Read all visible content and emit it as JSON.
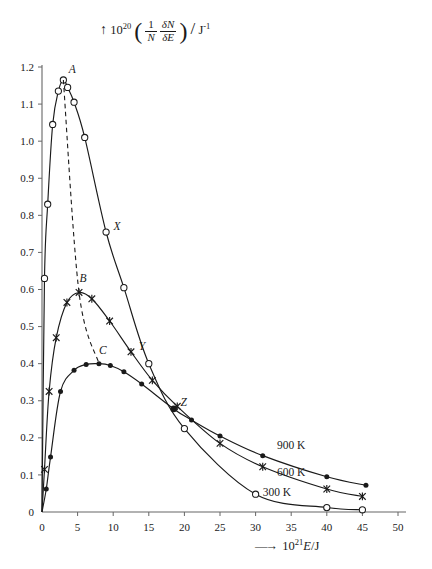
{
  "chart_data": {
    "type": "line",
    "title": "",
    "ylabel_parts": {
      "prefix": "10",
      "prefix_exp": "20",
      "numerator_1": "1",
      "denominator_1": "N",
      "numerator_2": "δN",
      "denominator_2": "δE",
      "unit": "J",
      "unit_exp": "-1"
    },
    "xlabel_parts": {
      "prefix": "10",
      "prefix_exp": "21",
      "variable": "E",
      "unit": "J"
    },
    "xlim": [
      0,
      50
    ],
    "ylim": [
      0,
      1.2
    ],
    "xticks": [
      0,
      5,
      10,
      15,
      20,
      25,
      30,
      35,
      40,
      45,
      50
    ],
    "xticklabels": [
      "0",
      "5",
      "10",
      "15",
      "20",
      "25",
      "30",
      "35",
      "40",
      "45",
      "50"
    ],
    "yticks": [
      0,
      0.1,
      0.2,
      0.3,
      0.4,
      0.5,
      0.6,
      0.7,
      0.8,
      0.9,
      1.0,
      1.1,
      1.2
    ],
    "yticklabels": [
      "0",
      "0.1",
      "0.2",
      "0.3",
      "0.4",
      "0.5",
      "0.6",
      "0.7",
      "0.8",
      "0.9",
      "1.0",
      "1.1",
      "1.2"
    ],
    "grid": false,
    "legend_position": "inline-right",
    "series": [
      {
        "name": "300 K",
        "label": "300 K",
        "marker": "open-circle",
        "color": "#1a1a1a",
        "points": [
          [
            0.0,
            0.0
          ],
          [
            0.35,
            0.63
          ],
          [
            0.8,
            0.83
          ],
          [
            1.5,
            1.045
          ],
          [
            2.3,
            1.135
          ],
          [
            3.0,
            1.165
          ],
          [
            3.6,
            1.145
          ],
          [
            4.5,
            1.105
          ],
          [
            6.0,
            1.01
          ],
          [
            9.0,
            0.755
          ],
          [
            11.5,
            0.605
          ],
          [
            15.0,
            0.4
          ],
          [
            20.0,
            0.225
          ],
          [
            30.0,
            0.048
          ],
          [
            40.0,
            0.012
          ],
          [
            45.0,
            0.006
          ]
        ]
      },
      {
        "name": "600 K",
        "label": "600 K",
        "marker": "cross",
        "color": "#1a1a1a",
        "points": [
          [
            0.0,
            0.0
          ],
          [
            0.35,
            0.115
          ],
          [
            1.0,
            0.325
          ],
          [
            2.0,
            0.47
          ],
          [
            3.5,
            0.565
          ],
          [
            5.2,
            0.592
          ],
          [
            7.0,
            0.575
          ],
          [
            9.5,
            0.515
          ],
          [
            12.5,
            0.432
          ],
          [
            15.5,
            0.355
          ],
          [
            19.0,
            0.285
          ],
          [
            25.0,
            0.185
          ],
          [
            31.0,
            0.122
          ],
          [
            40.0,
            0.062
          ],
          [
            45.0,
            0.042
          ]
        ]
      },
      {
        "name": "900 K",
        "label": "900 K",
        "marker": "filled-dot",
        "color": "#1a1a1a",
        "points": [
          [
            0.0,
            0.0
          ],
          [
            0.6,
            0.062
          ],
          [
            1.2,
            0.148
          ],
          [
            2.6,
            0.325
          ],
          [
            4.5,
            0.382
          ],
          [
            6.2,
            0.398
          ],
          [
            8.0,
            0.4
          ],
          [
            9.6,
            0.395
          ],
          [
            11.5,
            0.378
          ],
          [
            14.0,
            0.345
          ],
          [
            18.5,
            0.278
          ],
          [
            21.0,
            0.248
          ],
          [
            25.0,
            0.205
          ],
          [
            31.0,
            0.152
          ],
          [
            40.0,
            0.095
          ],
          [
            45.5,
            0.072
          ]
        ]
      }
    ],
    "peak_line": {
      "style": "dashed",
      "points": [
        [
          3.0,
          1.165
        ],
        [
          5.2,
          0.592
        ],
        [
          8.0,
          0.4
        ]
      ]
    },
    "annotations": [
      {
        "text": "A",
        "x": 3.0,
        "y": 1.165,
        "dx": 9,
        "dy": -7,
        "marker": "none"
      },
      {
        "text": "B",
        "x": 5.2,
        "y": 0.592,
        "dx": 4,
        "dy": -10,
        "marker": "none"
      },
      {
        "text": "C",
        "x": 8.0,
        "y": 0.4,
        "dx": 4,
        "dy": -10,
        "marker": "none"
      },
      {
        "text": "X",
        "x": 9.0,
        "y": 0.755,
        "dx": 11,
        "dy": -2,
        "marker": "none"
      },
      {
        "text": "Y",
        "x": 12.5,
        "y": 0.432,
        "dx": 11,
        "dy": -2,
        "marker": "none"
      },
      {
        "text": "Z",
        "x": 18.5,
        "y": 0.278,
        "dx": 10,
        "dy": -3,
        "marker": "filled-dot"
      }
    ],
    "series_labels": [
      {
        "text": "900 K",
        "x": 33.0,
        "y": 0.17
      },
      {
        "text": "600 K",
        "x": 33.0,
        "y": 0.098
      },
      {
        "text": "300 K",
        "x": 31.0,
        "y": 0.043
      }
    ]
  }
}
